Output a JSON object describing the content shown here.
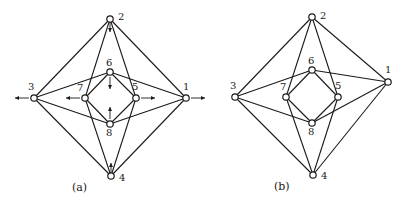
{
  "figure": {
    "panels": [
      {
        "id": "a",
        "caption": "(a)",
        "nodes": [
          {
            "id": "1",
            "label": "1"
          },
          {
            "id": "2",
            "label": "2"
          },
          {
            "id": "3",
            "label": "3"
          },
          {
            "id": "4",
            "label": "4"
          },
          {
            "id": "5",
            "label": "5"
          },
          {
            "id": "6",
            "label": "6"
          },
          {
            "id": "7",
            "label": "7"
          },
          {
            "id": "8",
            "label": "8"
          }
        ],
        "edges": [
          [
            "2",
            "3"
          ],
          [
            "2",
            "1"
          ],
          [
            "3",
            "4"
          ],
          [
            "1",
            "4"
          ],
          [
            "2",
            "7"
          ],
          [
            "2",
            "5"
          ],
          [
            "4",
            "7"
          ],
          [
            "4",
            "5"
          ],
          [
            "3",
            "6"
          ],
          [
            "3",
            "8"
          ],
          [
            "1",
            "6"
          ],
          [
            "1",
            "8"
          ],
          [
            "6",
            "7"
          ],
          [
            "6",
            "5"
          ],
          [
            "7",
            "8"
          ],
          [
            "5",
            "8"
          ]
        ],
        "arrows": [
          {
            "node": "1",
            "direction": "right"
          },
          {
            "node": "3",
            "direction": "left"
          },
          {
            "node": "5",
            "direction": "right"
          },
          {
            "node": "7",
            "direction": "left"
          },
          {
            "node": "6",
            "direction": "down"
          },
          {
            "node": "8",
            "direction": "up"
          },
          {
            "node": "2",
            "direction": "down"
          },
          {
            "node": "4",
            "direction": "up"
          }
        ]
      },
      {
        "id": "b",
        "caption": "(b)",
        "nodes": [
          {
            "id": "1",
            "label": "1"
          },
          {
            "id": "2",
            "label": "2"
          },
          {
            "id": "3",
            "label": "3"
          },
          {
            "id": "4",
            "label": "4"
          },
          {
            "id": "5",
            "label": "5"
          },
          {
            "id": "6",
            "label": "6"
          },
          {
            "id": "7",
            "label": "7"
          },
          {
            "id": "8",
            "label": "8"
          }
        ],
        "edges": [
          [
            "2",
            "3"
          ],
          [
            "2",
            "1"
          ],
          [
            "3",
            "4"
          ],
          [
            "1",
            "4"
          ],
          [
            "2",
            "7"
          ],
          [
            "2",
            "5"
          ],
          [
            "4",
            "7"
          ],
          [
            "4",
            "5"
          ],
          [
            "3",
            "6"
          ],
          [
            "3",
            "8"
          ],
          [
            "1",
            "6"
          ],
          [
            "1",
            "8"
          ],
          [
            "6",
            "7"
          ],
          [
            "6",
            "5"
          ],
          [
            "7",
            "8"
          ],
          [
            "5",
            "8"
          ]
        ],
        "arrows": []
      }
    ]
  }
}
